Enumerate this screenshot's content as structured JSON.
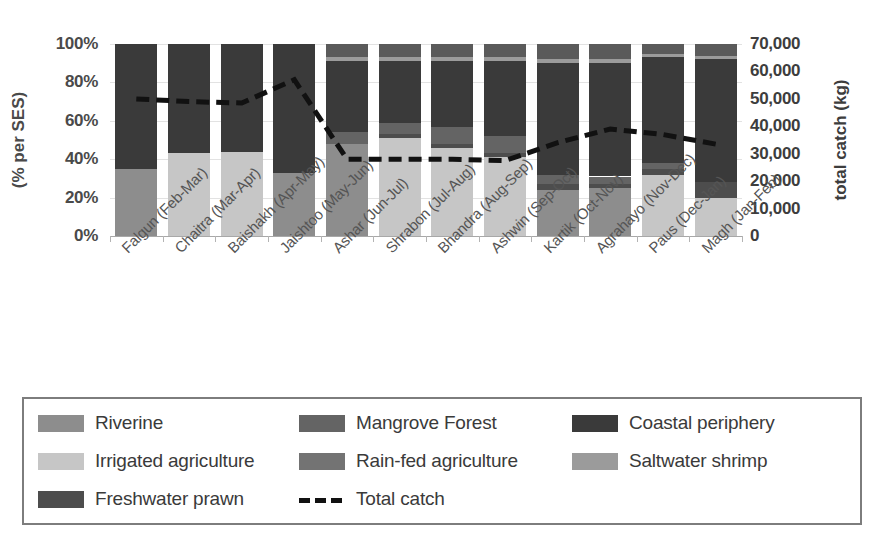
{
  "chart_data": {
    "type": "bar",
    "subtype": "stacked-percent-bar-with-line-overlay",
    "title": "",
    "xlabel": "",
    "ylabel": "(% per SES)",
    "y2label": "total catch (kg)",
    "ylim": [
      0,
      100
    ],
    "ytick_labels": [
      "0%",
      "20%",
      "40%",
      "60%",
      "80%",
      "100%"
    ],
    "ytick_values": [
      0,
      20,
      40,
      60,
      80,
      100
    ],
    "y2lim": [
      0,
      70000
    ],
    "y2tick_labels": [
      "0",
      "10,000",
      "20,000",
      "30,000",
      "40,000",
      "50,000",
      "60,000",
      "70,000"
    ],
    "y2tick_values": [
      0,
      10000,
      20000,
      30000,
      40000,
      50000,
      60000,
      70000
    ],
    "grid": true,
    "legend_position": "bottom",
    "categories": [
      "Falgun (Feb-Mar)",
      "Chaitra (Mar-Apr)",
      "Baishakh (Apr-May)",
      "Jaishtoo (May-Jun)",
      "Ashar (Jun-Jul)",
      "Shrabon (Jul-Aug)",
      "Bhandra (Aug-Sep)",
      "Ashwin (Sep-Oct)",
      "Kartik (Oct-Nov)",
      "Agrahayo (Nov-Dec)",
      "Paus (Dec-Jan)",
      "Magh (Jan-Feb)"
    ],
    "series": [
      {
        "name": "Riverine",
        "color": "#8d8d8d",
        "values": [
          35,
          0,
          0,
          33,
          48,
          0,
          0,
          0,
          24,
          25,
          0,
          0
        ]
      },
      {
        "name": "Irrigated agriculture",
        "color": "#c6c6c6",
        "values": [
          0,
          43,
          44,
          0,
          0,
          51,
          46,
          41,
          0,
          0,
          32,
          20
        ]
      },
      {
        "name": "Freshwater prawn",
        "color": "#4d4d4d",
        "values": [
          0,
          0,
          0,
          0,
          0,
          2,
          2,
          2,
          3,
          2,
          3,
          8
        ]
      },
      {
        "name": "Mangrove Forest",
        "color": "#646464",
        "values": [
          0,
          0,
          0,
          0,
          6,
          6,
          9,
          9,
          5,
          4,
          3,
          0
        ]
      },
      {
        "name": "Rain-fed agriculture",
        "color": "#737373",
        "values": [
          0,
          0,
          0,
          0,
          0,
          0,
          0,
          0,
          0,
          0,
          0,
          0
        ]
      },
      {
        "name": "Coastal periphery",
        "color": "#3a3a3a",
        "values": [
          65,
          57,
          56,
          67,
          37,
          32,
          34,
          39,
          58,
          59,
          55,
          64
        ]
      },
      {
        "name": "Saltwater shrimp",
        "color": "#9b9b9b",
        "values": [
          0,
          0,
          0,
          0,
          2,
          2,
          2,
          2,
          2,
          2,
          2,
          2
        ]
      },
      {
        "name": "Coastal periphery top",
        "color": "#5a5a5a",
        "values": [
          0,
          0,
          0,
          0,
          7,
          7,
          7,
          7,
          8,
          8,
          5,
          6
        ]
      }
    ],
    "stack_order": [
      "Riverine",
      "Irrigated agriculture",
      "Freshwater prawn",
      "Mangrove Forest",
      "Rain-fed agriculture",
      "Coastal periphery",
      "Saltwater shrimp",
      "Coastal periphery top"
    ],
    "line": {
      "name": "Total catch",
      "style": "dashed",
      "color": "#111111",
      "axis": "y2",
      "unit": "kg",
      "values": [
        50000,
        49000,
        48500,
        57000,
        28000,
        28000,
        28000,
        27500,
        34000,
        39000,
        37000,
        33500
      ]
    }
  },
  "legend": {
    "items": [
      {
        "label": "Riverine",
        "color": "#8d8d8d",
        "type": "swatch"
      },
      {
        "label": "Mangrove Forest",
        "color": "#646464",
        "type": "swatch"
      },
      {
        "label": "Coastal periphery",
        "color": "#3a3a3a",
        "type": "swatch"
      },
      {
        "label": "Irrigated agriculture",
        "color": "#c6c6c6",
        "type": "swatch"
      },
      {
        "label": "Rain-fed agriculture",
        "color": "#737373",
        "type": "swatch"
      },
      {
        "label": "Saltwater shrimp",
        "color": "#9b9b9b",
        "type": "swatch"
      },
      {
        "label": "Freshwater prawn",
        "color": "#4d4d4d",
        "type": "swatch"
      },
      {
        "label": "Total catch",
        "color": "#111111",
        "type": "dashed-line"
      }
    ]
  }
}
